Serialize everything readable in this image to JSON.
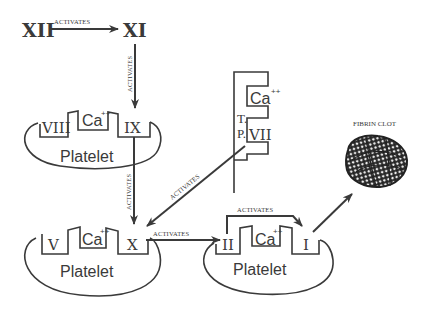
{
  "diagram": {
    "type": "coagulation-cascade",
    "colors": {
      "ink": "#3a3a3a",
      "background": "#ffffff"
    },
    "factors": {
      "f12": "XII",
      "f11": "XI",
      "f9": "IX",
      "f8": "VIII",
      "f7": "VII",
      "f10": "X",
      "f5": "V",
      "f2": "II",
      "f1": "I"
    },
    "calcium": {
      "symbol": "Ca",
      "charge": "++"
    },
    "platelet_label": "Platelet",
    "tissue_factor_label": {
      "line1": "T.",
      "line2": "P."
    },
    "edge_label": "ACTIVATES",
    "product_label": "FIBRIN CLOT",
    "edges": [
      {
        "from": "XII",
        "to": "XI",
        "label": "ACTIVATES"
      },
      {
        "from": "XI",
        "to": "IX",
        "label": "ACTIVATES"
      },
      {
        "from": "IX",
        "to": "X",
        "label": "ACTIVATES"
      },
      {
        "from": "VII",
        "to": "X",
        "label": "ACTIVATES"
      },
      {
        "from": "X",
        "to": "II",
        "label": "ACTIVATES"
      },
      {
        "from": "II",
        "to": "I",
        "label": "ACTIVATES"
      },
      {
        "from": "I",
        "to": "FIBRIN CLOT",
        "label": ""
      }
    ]
  }
}
